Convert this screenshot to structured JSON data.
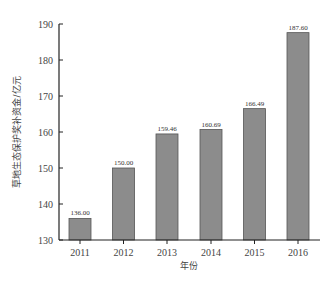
{
  "chart_data": {
    "type": "bar",
    "title": "",
    "xlabel": "年份",
    "ylabel": "草地生态保护奖补资金/亿元",
    "categories": [
      "2011",
      "2012",
      "2013",
      "2014",
      "2015",
      "2016"
    ],
    "values": [
      136.0,
      150.0,
      159.46,
      160.69,
      166.49,
      187.6
    ],
    "value_labels": [
      "136.00",
      "150.00",
      "159.46",
      "160.69",
      "166.49",
      "187.60"
    ],
    "ylim": [
      130,
      190
    ],
    "yticks": [
      130,
      140,
      150,
      160,
      170,
      180,
      190
    ],
    "grid": false,
    "legend": null,
    "bar_color": "#8c8c8c",
    "bar_edge_color": "#555555"
  }
}
